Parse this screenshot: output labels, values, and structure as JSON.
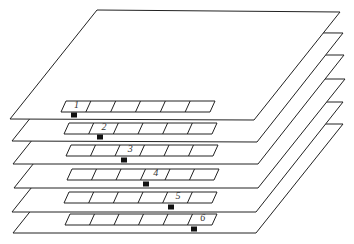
{
  "diagram": {
    "stroke_color": "#222222",
    "fill_color": "#ffffff",
    "marker_color": "#111111",
    "layers": [
      {
        "id": 1,
        "label": "1",
        "highlight_cell": 0,
        "tl": [
          97,
          10
        ],
        "tr": [
          340,
          12
        ],
        "br": [
          254,
          120
        ],
        "bl": [
          10,
          119
        ],
        "strip": {
          "tl": [
            66,
            101
          ],
          "tr": [
            215,
            101
          ],
          "br": [
            210,
            112
          ],
          "bl": [
            61,
            112
          ]
        },
        "marker": [
          74,
          115
        ]
      },
      {
        "id": 2,
        "label": "2",
        "highlight_cell": 1,
        "tl": [
          0,
          0
        ],
        "tr": [
          343,
          33
        ],
        "br": [
          257,
          142
        ],
        "bl": [
          12,
          141
        ],
        "strip": {
          "tl": [
            69,
            123
          ],
          "tr": [
            217,
            123
          ],
          "br": [
            212,
            134
          ],
          "bl": [
            64,
            134
          ]
        },
        "marker": [
          100,
          137
        ]
      },
      {
        "id": 3,
        "label": "3",
        "highlight_cell": 2,
        "tl": [
          0,
          0
        ],
        "tr": [
          344,
          55
        ],
        "br": [
          258,
          164
        ],
        "bl": [
          13,
          164
        ],
        "strip": {
          "tl": [
            71,
            145
          ],
          "tr": [
            218,
            145
          ],
          "br": [
            213,
            156
          ],
          "bl": [
            66,
            156
          ]
        },
        "marker": [
          124,
          160
        ]
      },
      {
        "id": 4,
        "label": "4",
        "highlight_cell": 3,
        "tl": [
          0,
          0
        ],
        "tr": [
          345,
          79
        ],
        "br": [
          258,
          188
        ],
        "bl": [
          14,
          188
        ],
        "strip": {
          "tl": [
            72,
            169
          ],
          "tr": [
            219,
            169
          ],
          "br": [
            214,
            180
          ],
          "bl": [
            67,
            180
          ]
        },
        "marker": [
          146,
          184
        ]
      },
      {
        "id": 5,
        "label": "5",
        "highlight_cell": 4,
        "tl": [
          0,
          0
        ],
        "tr": [
          343,
          102
        ],
        "br": [
          256,
          212
        ],
        "bl": [
          12,
          212
        ],
        "strip": {
          "tl": [
            69,
            192
          ],
          "tr": [
            217,
            192
          ],
          "br": [
            212,
            203
          ],
          "bl": [
            64,
            203
          ]
        },
        "marker": [
          171,
          207
        ]
      },
      {
        "id": 6,
        "label": "6",
        "highlight_cell": 5,
        "tl": [
          0,
          0
        ],
        "tr": [
          343,
          124
        ],
        "br": [
          256,
          233
        ],
        "bl": [
          13,
          233
        ],
        "strip": {
          "tl": [
            70,
            214
          ],
          "tr": [
            217,
            214
          ],
          "br": [
            212,
            225
          ],
          "bl": [
            65,
            225
          ]
        },
        "marker": [
          194,
          229
        ]
      }
    ],
    "cells_per_strip": 6
  }
}
